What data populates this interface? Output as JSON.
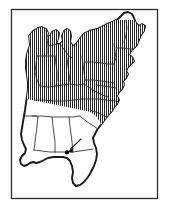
{
  "figure": {
    "kind": "map",
    "title": "",
    "caption": "",
    "region": "Eastern United States",
    "background_color": "#ffffff",
    "frame": {
      "name": "map-border",
      "color": "#2b2b2b",
      "x": 11,
      "y": 9,
      "width": 147,
      "height": 190
    }
  },
  "legend": {
    "present": false,
    "entries": [
      {
        "pattern": "vertical-hatch",
        "label": "",
        "color": "#1a1a1a",
        "meaning": "shaded range"
      },
      {
        "pattern": "white",
        "label": "",
        "color": "#ffffff",
        "meaning": "unshaded range"
      }
    ]
  },
  "annotations": [
    {
      "name": "locality-arrow",
      "type": "arrow",
      "label": "",
      "color": "#111111",
      "tip": {
        "x": 68,
        "y": 151
      },
      "tail": {
        "x": 81,
        "y": 139
      }
    },
    {
      "name": "locality-dot",
      "type": "point-marker",
      "label": "",
      "color": "#000000",
      "position": {
        "x": 67,
        "y": 152
      },
      "radius": 2.1
    }
  ],
  "map_regions": {
    "shaded": {
      "pattern": "vertical-hatch",
      "line_color": "#1a1a1a",
      "line_spacing_px": 2,
      "line_width_px": 0.9,
      "description": "Northern and northeastern states plus the Atlantic seaboard south to the Carolinas"
    },
    "unshaded": {
      "fill_color": "#ffffff",
      "description": "Gulf coastal states and Florida peninsula"
    }
  },
  "colors": {
    "outline": "#1a1a1a",
    "state_border": "#2a2a2a",
    "hatch": "#1a1a1a",
    "frame": "#2b2b2b",
    "page": "#ffffff",
    "marker": "#000000"
  }
}
